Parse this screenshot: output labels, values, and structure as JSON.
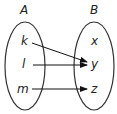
{
  "diagram": {
    "type": "mapping",
    "sets": [
      {
        "name": "A",
        "elements": [
          "k",
          "l",
          "m"
        ]
      },
      {
        "name": "B",
        "elements": [
          "x",
          "y",
          "z"
        ]
      }
    ],
    "mappings": [
      {
        "from": "k",
        "to": "y"
      },
      {
        "from": "l",
        "to": "y"
      },
      {
        "from": "m",
        "to": "z"
      }
    ],
    "colors": {
      "stroke": "#333333",
      "arrow": "#111111",
      "text": "#222222"
    }
  }
}
